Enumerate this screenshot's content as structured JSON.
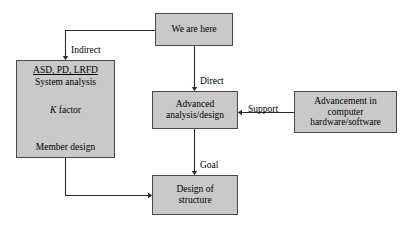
{
  "diagram": {
    "style": {
      "node_fill": "#c9c9c9",
      "node_border": "#4a4a4a",
      "text_color": "#000000",
      "background": "#ffffff",
      "edge_color": "#2b2b2b"
    },
    "nodes": {
      "we_are_here": {
        "label": "We are here"
      },
      "methods": {
        "header": "ASD, PD, LRFD",
        "subheader": "System analysis",
        "k_factor_prefix": "K",
        "k_factor_suffix": " factor",
        "member_design": "Member design"
      },
      "advanced": {
        "line1": "Advanced",
        "line2": "analysis/design"
      },
      "hardware": {
        "line1": "Advancement in",
        "line2": "computer",
        "line3": "hardware/software"
      },
      "design_structure": {
        "line1": "Design of",
        "line2": "structure"
      }
    },
    "edges": {
      "indirect": "Indirect",
      "direct": "Direct",
      "support": "Support",
      "goal": "Goal"
    }
  }
}
